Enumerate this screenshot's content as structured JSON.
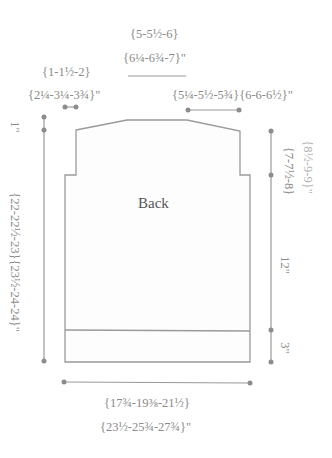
{
  "title": "Back",
  "colors": {
    "outline": "#999999",
    "text": "#8a8a8a",
    "text_light": "#b4b4b4",
    "dot": "#8c8c8c"
  },
  "labels": {
    "neck_width_top": "{5-5½-6}",
    "neck_width_bottom": "{6¼-6¾-7}\"",
    "shoulder_left_top": "{1-1½-2}",
    "shoulder_left_bottom": "{2¼-3¼-3¾}\"",
    "shoulder_right": "{5¼-5½-5¾}{6-6-6½}\"",
    "neck_depth": "1\"",
    "total_length": "{22-22½-23}{23½-24-24}\"",
    "armhole_depth": "{7-7½-8}",
    "armhole_depth_2": "{8½-9-9}\"",
    "side_length": "12\"",
    "ribbing_length": "3\"",
    "width_top": "{17¾-19⅜-21½}",
    "width_bottom": "{23½-25¾-27¾}\""
  }
}
